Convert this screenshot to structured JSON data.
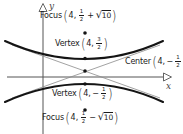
{
  "figure_type": "hyperbola graph with vertical transverse axis",
  "axes": {
    "x_label": "x",
    "y_label": "y"
  },
  "symbols": {
    "paren_open": "(",
    "paren_close": ")",
    "radical": "√"
  },
  "points": {
    "focus_top": {
      "name": "Focus",
      "x": "4,",
      "sign": "",
      "frac_num": "1",
      "frac_den": "2",
      "op": "+",
      "radicand": "10"
    },
    "vertex_top": {
      "name": "Vertex",
      "x": "4,",
      "sign": "",
      "frac_num": "3",
      "frac_den": "2"
    },
    "center": {
      "name": "Center",
      "x": "4,",
      "sign": "−",
      "frac_num": "1",
      "frac_den": "2"
    },
    "vertex_bottom": {
      "name": "Vertex",
      "x": "4,",
      "sign": "−",
      "frac_num": "1",
      "frac_den": "2"
    },
    "focus_bottom": {
      "name": "Focus",
      "x": "4,",
      "sign": "",
      "frac_num": "1",
      "frac_den": "2",
      "op": "−",
      "radicand": "10"
    }
  },
  "colors": {
    "ink": "#1a1a1a",
    "axis_gray": "#555555",
    "asymptote_gray": "#8a8a8a",
    "background": "#ffffff"
  }
}
